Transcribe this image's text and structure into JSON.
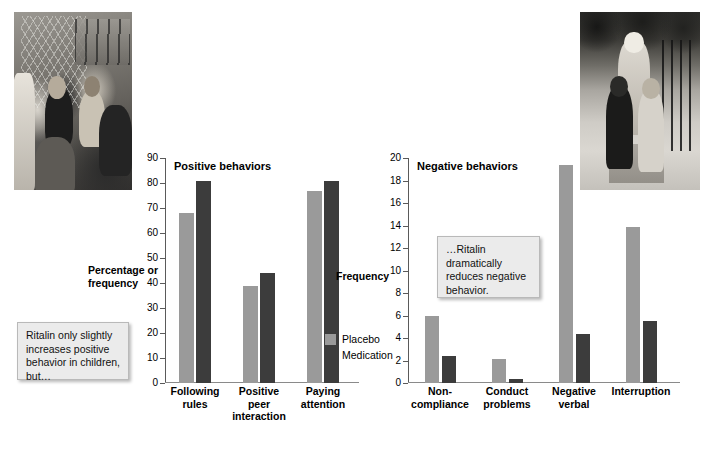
{
  "photos": [
    {
      "name": "children-at-fence-photo",
      "alt": "Black and white photo of children gathered by a chain-link fence"
    },
    {
      "name": "adult-with-children-photo",
      "alt": "Black and white photo of an adult walking with two children on a sidewalk"
    }
  ],
  "callouts": {
    "left": "Ritalin only slightly increases positive behavior in children, but…",
    "right": "…Ritalin dramatically reduces negative behavior."
  },
  "legend": {
    "items": [
      {
        "label": "Placebo",
        "color": "#9a9a9a"
      },
      {
        "label": "Medication",
        "color": "#3c3c3c"
      }
    ]
  },
  "chart_data": [
    {
      "type": "bar",
      "title": "Positive behaviors",
      "xlabel": "",
      "ylabel": "Percentage or frequency",
      "categories": [
        "Following rules",
        "Positive peer interaction",
        "Paying attention"
      ],
      "series": [
        {
          "name": "Placebo",
          "color": "#9a9a9a",
          "values": [
            68,
            39,
            77
          ]
        },
        {
          "name": "Medication",
          "color": "#3c3c3c",
          "values": [
            81,
            44,
            81
          ]
        }
      ],
      "ylim": [
        0,
        90
      ],
      "yticks": [
        0,
        10,
        20,
        30,
        40,
        50,
        60,
        70,
        80,
        90
      ],
      "grid": false,
      "legend_position": "right"
    },
    {
      "type": "bar",
      "title": "Negative behaviors",
      "xlabel": "",
      "ylabel": "Frequency",
      "categories": [
        "Non-compliance",
        "Conduct problems",
        "Negative verbal",
        "Interruption"
      ],
      "series": [
        {
          "name": "Placebo",
          "color": "#9a9a9a",
          "values": [
            6.0,
            2.1,
            19.4,
            13.9
          ]
        },
        {
          "name": "Medication",
          "color": "#3c3c3c",
          "values": [
            2.4,
            0.4,
            4.4,
            5.5
          ]
        }
      ],
      "ylim": [
        0,
        20
      ],
      "yticks": [
        0,
        2,
        4,
        6,
        8,
        10,
        12,
        14,
        16,
        18,
        20
      ],
      "grid": false,
      "legend_position": "left"
    }
  ]
}
